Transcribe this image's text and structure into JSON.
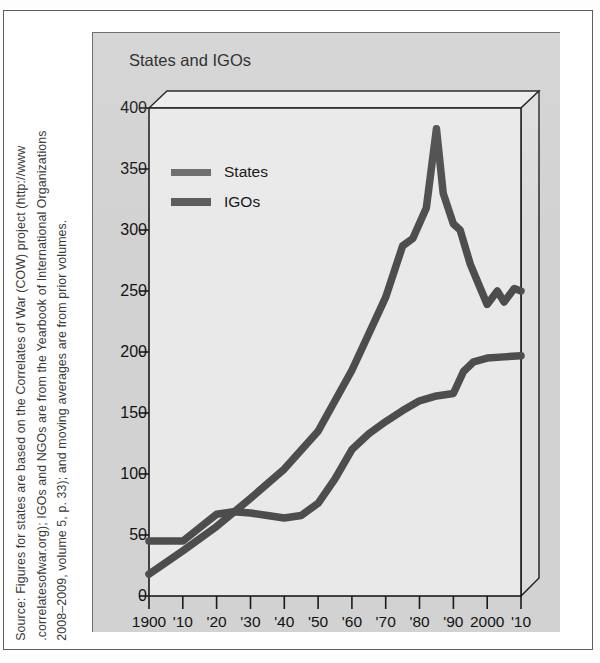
{
  "figure": {
    "panel_title": "States and IGOs",
    "source_lines": [
      "Source: Figures for states are based on the Correlates of War (COW) project (http://www",
      ".correlatesofwar.org); IGOs and NGOs are from the Yearbook of International Organizations",
      "2008–2009, volume 5, p. 33); and moving averages are from prior volumes."
    ]
  },
  "colors": {
    "panel_background": "#d2d2d2",
    "plot_background": "#e8e8e8",
    "series_line": "#4d4d4d",
    "axis": "#1b1b1b",
    "page_background": "#ffffff"
  },
  "chart_data": {
    "type": "line",
    "title": "States and IGOs",
    "xlabel": "",
    "ylabel": "",
    "xlim": [
      1900,
      2010
    ],
    "ylim": [
      0,
      400
    ],
    "grid": false,
    "legend_position": "upper-left-inside",
    "x_tick_labels": [
      "1900",
      "'10",
      "'20",
      "'30",
      "'40",
      "'50",
      "'60",
      "'70",
      "'80",
      "'90",
      "2000",
      "'10"
    ],
    "x_tick_values": [
      1900,
      1910,
      1920,
      1930,
      1940,
      1950,
      1960,
      1970,
      1980,
      1990,
      2000,
      2010
    ],
    "y_tick_labels": [
      "0",
      "50",
      "100",
      "150",
      "200",
      "250",
      "300",
      "350",
      "400"
    ],
    "y_tick_values": [
      0,
      50,
      100,
      150,
      200,
      250,
      300,
      350,
      400
    ],
    "series": [
      {
        "name": "States",
        "x": [
          1900,
          1905,
          1910,
          1915,
          1920,
          1925,
          1930,
          1935,
          1940,
          1945,
          1950,
          1955,
          1960,
          1965,
          1970,
          1975,
          1980,
          1985,
          1990,
          1993,
          1996,
          2000,
          2005,
          2010
        ],
        "values": [
          45,
          45,
          45,
          56,
          67,
          69,
          68,
          66,
          64,
          66,
          76,
          96,
          120,
          133,
          143,
          152,
          160,
          164,
          166,
          184,
          192,
          195,
          196,
          197
        ]
      },
      {
        "name": "IGOs",
        "x": [
          1900,
          1910,
          1920,
          1930,
          1940,
          1950,
          1960,
          1965,
          1970,
          1975,
          1978,
          1982,
          1985,
          1987,
          1990,
          1992,
          1995,
          1998,
          2000,
          2003,
          2005,
          2008,
          2010
        ],
        "values": [
          18,
          37,
          57,
          80,
          104,
          135,
          185,
          215,
          245,
          287,
          293,
          318,
          383,
          330,
          305,
          300,
          272,
          252,
          239,
          250,
          241,
          252,
          250
        ]
      }
    ],
    "annotations": [
      {
        "text": "IGO peak",
        "x": 1985,
        "y": 383
      }
    ]
  }
}
